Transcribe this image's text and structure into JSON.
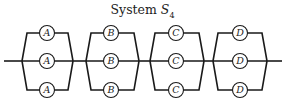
{
  "title": {
    "text": "System ",
    "symbol": "S",
    "subscript": "4"
  },
  "layout": {
    "line_y": 61,
    "line_start_x": 4,
    "line_end_x": 282,
    "row_y": [
      33,
      61,
      90
    ],
    "circle_r": 7.5,
    "stroke_color": "#1a1a1a"
  },
  "blocks": [
    {
      "label": "A",
      "left_x": 22,
      "right_x": 73,
      "center_x": 47,
      "count": 3
    },
    {
      "label": "B",
      "left_x": 86,
      "right_x": 139,
      "center_x": 111,
      "count": 3
    },
    {
      "label": "C",
      "left_x": 150,
      "right_x": 204,
      "center_x": 176,
      "count": 3
    },
    {
      "label": "D",
      "left_x": 213,
      "right_x": 267,
      "center_x": 240,
      "count": 3
    }
  ]
}
